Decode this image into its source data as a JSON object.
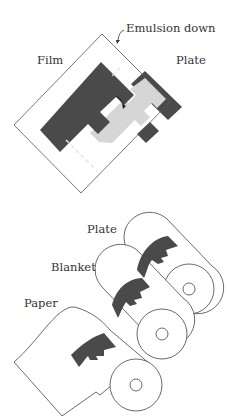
{
  "top_diagram": {
    "labels": {
      "emulsion": "Emulsion down",
      "film": "Film",
      "plate": "Plate"
    }
  },
  "bottom_diagram": {
    "labels": {
      "plate": "Plate",
      "blanket": "Blanket",
      "paper": "Paper"
    }
  },
  "colors": {
    "dark_fill": "#4a4a4a",
    "light_fill": "#d6d6d6",
    "line": "#555555"
  }
}
